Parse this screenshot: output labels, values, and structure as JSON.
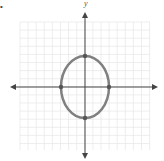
{
  "figure": {
    "corner_mark": "•",
    "axis_labels": {
      "y": "y"
    },
    "grid": {
      "x0": 20,
      "x1": 150,
      "y0": 22,
      "y1": 150,
      "step": 8.1,
      "color": "#e6e6e6"
    },
    "axes": {
      "origin_x": 85,
      "origin_y": 87,
      "color": "#444444"
    },
    "ellipse": {
      "cx": 85,
      "cy": 87,
      "rx": 24,
      "ry": 31,
      "stroke": "#808080",
      "stroke_width": 2.5,
      "vertices": [
        {
          "name": "left",
          "x": 61,
          "y": 87
        },
        {
          "name": "right",
          "x": 109,
          "y": 87
        },
        {
          "name": "top",
          "x": 85,
          "y": 56
        },
        {
          "name": "bottom",
          "x": 85,
          "y": 118
        }
      ],
      "point_color": "#555555"
    }
  }
}
